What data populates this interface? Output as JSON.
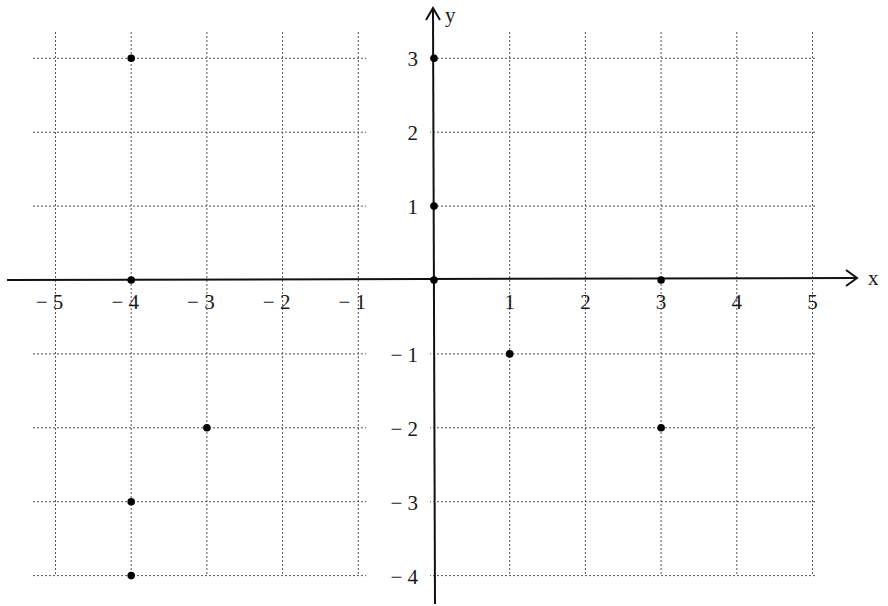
{
  "chart_data": {
    "type": "scatter",
    "title": "",
    "xlabel": "x",
    "ylabel": "y",
    "xlim": [
      -5,
      5
    ],
    "ylim": [
      -4,
      3
    ],
    "grid": true,
    "grid_style": "dotted",
    "x_ticks": [
      -5,
      -4,
      -3,
      -2,
      -1,
      1,
      2,
      3,
      4,
      5
    ],
    "y_ticks": [
      3,
      2,
      1,
      -1,
      -2,
      -3,
      -4
    ],
    "x_tick_labels": [
      "− 5",
      "− 4",
      "− 3",
      "− 2",
      "− 1",
      "1",
      "2",
      "3",
      "4",
      "5"
    ],
    "y_tick_labels": [
      "3",
      "2",
      "1",
      "− 1",
      "− 2",
      "− 3",
      "− 4"
    ],
    "points": [
      {
        "x": -4,
        "y": 3
      },
      {
        "x": 0,
        "y": 3
      },
      {
        "x": 0,
        "y": 1
      },
      {
        "x": -4,
        "y": 0
      },
      {
        "x": 0,
        "y": 0
      },
      {
        "x": 3,
        "y": 0
      },
      {
        "x": 1,
        "y": -1
      },
      {
        "x": -3,
        "y": -2
      },
      {
        "x": 3,
        "y": -2
      },
      {
        "x": -4,
        "y": -3
      },
      {
        "x": -4,
        "y": -4
      }
    ]
  },
  "colors": {
    "axis": "#111111",
    "grid": "#555555",
    "point": "#000000",
    "background": "#ffffff"
  },
  "axes": {
    "x_label": "x",
    "y_label": "y"
  }
}
